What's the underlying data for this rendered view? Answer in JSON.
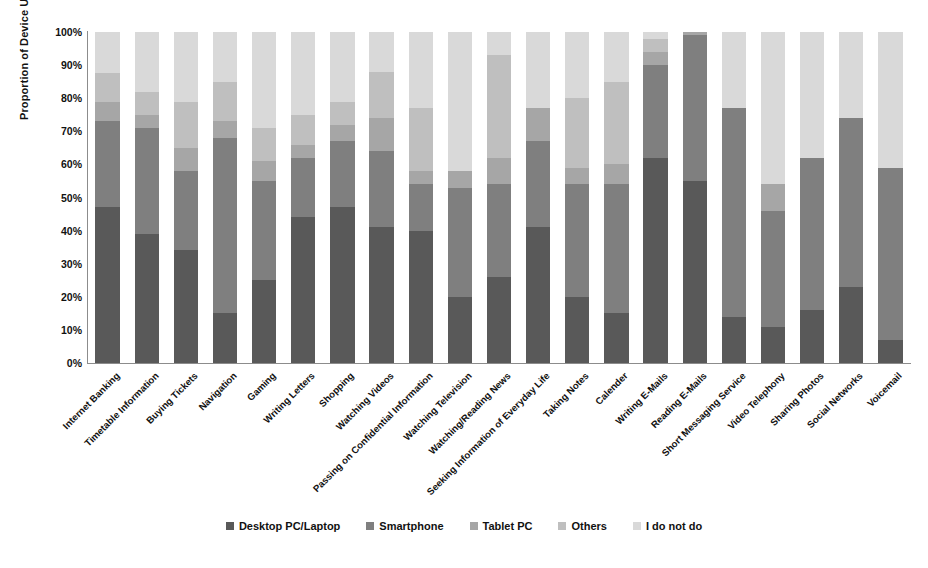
{
  "chart_data": {
    "type": "bar",
    "subtype": "stacked-100-percent",
    "title": "",
    "xlabel": "",
    "ylabel": "Proportion of Device Used",
    "ylim": [
      0,
      100
    ],
    "ytick_labels": [
      "100%",
      "90%",
      "80%",
      "70%",
      "60%",
      "50%",
      "40%",
      "30%",
      "20%",
      "10%",
      "0%"
    ],
    "ytick_values": [
      100,
      90,
      80,
      70,
      60,
      50,
      40,
      30,
      20,
      10,
      0
    ],
    "grid": false,
    "legend_position": "bottom",
    "orientation": "vertical",
    "categories": [
      "Internet Banking",
      "Timetable Information",
      "Buying Tickets",
      "Navigation",
      "Gaming",
      "Writing Letters",
      "Shopping",
      "Watching Videos",
      "Passing on Confidential Information",
      "Watching Television",
      "Watching/Reading News",
      "Seeking Information of Everyday Life",
      "Taking Notes",
      "Calender",
      "Writing E-Mails",
      "Reading E-Mails",
      "Short Messaging Service",
      "Video Telephony",
      "Sharing Photos",
      "Social Networks",
      "Voicemail"
    ],
    "series": [
      {
        "name": "Desktop PC/Laptop",
        "color": "#595959",
        "values": [
          47,
          39,
          34,
          15,
          25,
          44,
          47,
          41,
          40,
          20,
          26,
          41,
          20,
          15,
          62,
          55,
          14,
          11,
          16,
          23,
          7
        ]
      },
      {
        "name": "Smartphone",
        "color": "#7f7f7f",
        "values": [
          26,
          32,
          24,
          53,
          30,
          18,
          20,
          23,
          14,
          33,
          28,
          26,
          34,
          39,
          28,
          44,
          63,
          35,
          46,
          51,
          52
        ]
      },
      {
        "name": "Tablet PC",
        "color": "#a6a6a6",
        "values": [
          6,
          4,
          7,
          5,
          6,
          4,
          5,
          10,
          4,
          5,
          8,
          10,
          5,
          6,
          4,
          1,
          0,
          8,
          0,
          0,
          0
        ]
      },
      {
        "name": "Others",
        "color": "#bfbfbf",
        "values": [
          8.5,
          7,
          14,
          12,
          10,
          9,
          7,
          14,
          19,
          0,
          31,
          0,
          21,
          25,
          4,
          0,
          0,
          0,
          0,
          0,
          0
        ]
      },
      {
        "name": "I do not do",
        "color": "#d9d9d9",
        "values": [
          12.5,
          18,
          21,
          15,
          29,
          25,
          21,
          12,
          23,
          42,
          7,
          23,
          20,
          15,
          2,
          0,
          23,
          46,
          38,
          26,
          41
        ]
      }
    ]
  },
  "legend": {
    "items": [
      {
        "label": "Desktop PC/Laptop",
        "color": "#595959"
      },
      {
        "label": "Smartphone",
        "color": "#7f7f7f"
      },
      {
        "label": "Tablet PC",
        "color": "#a6a6a6"
      },
      {
        "label": "Others",
        "color": "#bfbfbf"
      },
      {
        "label": "I do not do",
        "color": "#d9d9d9"
      }
    ]
  }
}
